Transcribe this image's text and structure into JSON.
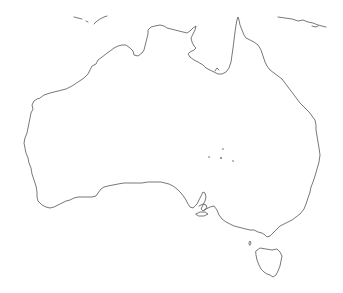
{
  "map": {
    "title": "",
    "region": "Australia",
    "style": "outline",
    "colors": {
      "background": "#ffffff",
      "coastline": "#555555"
    },
    "stroke_width": 0.8,
    "features": [
      {
        "name": "mainland",
        "type": "coastline"
      },
      {
        "name": "tasmania",
        "type": "coastline"
      },
      {
        "name": "kangaroo-island",
        "type": "coastline"
      },
      {
        "name": "new-guinea-south-coast",
        "type": "coastline"
      },
      {
        "name": "timor-islands",
        "type": "coastline"
      },
      {
        "name": "coral-sea-islets",
        "type": "points"
      },
      {
        "name": "king-island",
        "type": "coastline"
      }
    ]
  }
}
